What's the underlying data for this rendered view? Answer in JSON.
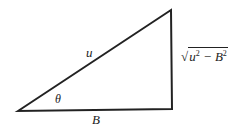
{
  "diagram": {
    "type": "right-triangle",
    "vertices": {
      "angle_vertex": [
        18,
        111
      ],
      "top": [
        171,
        10
      ],
      "right_angle": [
        172,
        109
      ]
    },
    "labels": {
      "hypotenuse": "u",
      "angle": "θ",
      "adjacent": "B",
      "opposite_prefix": "√",
      "opposite_u": "u",
      "opposite_exp1": "2",
      "opposite_minus": " − B",
      "opposite_exp2": "2"
    },
    "stroke_color": "#222222"
  }
}
